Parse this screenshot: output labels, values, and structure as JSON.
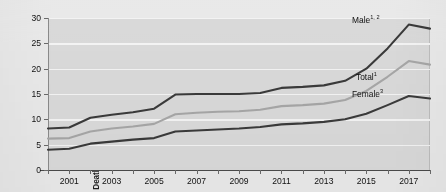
{
  "figure": {
    "title_fragment": "",
    "background_color": "#e9e9e9",
    "plot_background_color": "#d9d9d9",
    "gridline_color": "#f3f3f3"
  },
  "axis": {
    "ylabel": "Deaths per 100,000 standard population",
    "yticks": [
      "0",
      "5",
      "10",
      "15",
      "20",
      "25",
      "30"
    ],
    "xticks_labeled": [
      "2001",
      "2003",
      "2005",
      "2007",
      "2009",
      "2011",
      "2013",
      "2015",
      "2017"
    ]
  },
  "series_labels": {
    "male": "Male",
    "male_sup": "1, 2",
    "total": "Total",
    "total_sup": "1",
    "female": "Female",
    "female_sup": "3"
  },
  "chart_data": {
    "type": "line",
    "title": "",
    "xlabel": "",
    "ylabel": "Deaths per 100,000 standard population",
    "xlim": [
      2000,
      2018
    ],
    "ylim": [
      0,
      30
    ],
    "ytick_values": [
      0,
      5,
      10,
      15,
      20,
      25,
      30
    ],
    "xtick_values": [
      2000,
      2001,
      2002,
      2003,
      2004,
      2005,
      2006,
      2007,
      2008,
      2009,
      2010,
      2011,
      2012,
      2013,
      2014,
      2015,
      2016,
      2017,
      2018
    ],
    "xtick_labels_shown": [
      2001,
      2003,
      2005,
      2007,
      2009,
      2011,
      2013,
      2015,
      2017
    ],
    "grid": "horizontal",
    "legend": "inline-labels",
    "x": [
      2000,
      2001,
      2002,
      2003,
      2004,
      2005,
      2006,
      2007,
      2008,
      2009,
      2010,
      2011,
      2012,
      2013,
      2014,
      2015,
      2016,
      2017,
      2018
    ],
    "series": [
      {
        "name": "Male",
        "color": "#3a3a3a",
        "values": [
          8.2,
          8.4,
          10.3,
          10.9,
          11.4,
          12.1,
          14.9,
          15.0,
          15.0,
          15.0,
          15.2,
          16.2,
          16.4,
          16.7,
          17.6,
          20.0,
          24.0,
          28.7,
          27.9
        ]
      },
      {
        "name": "Total",
        "color": "#a6a6a6",
        "values": [
          6.2,
          6.3,
          7.6,
          8.2,
          8.6,
          9.1,
          11.0,
          11.3,
          11.5,
          11.6,
          11.9,
          12.6,
          12.8,
          13.1,
          13.8,
          15.6,
          18.4,
          21.5,
          20.8
        ]
      },
      {
        "name": "Female",
        "color": "#3a3a3a",
        "values": [
          4.0,
          4.2,
          5.2,
          5.6,
          6.0,
          6.3,
          7.6,
          7.8,
          8.0,
          8.2,
          8.5,
          9.0,
          9.2,
          9.5,
          10.0,
          11.1,
          12.8,
          14.6,
          14.1
        ]
      }
    ],
    "annotations": [
      {
        "text": "Male1, 2",
        "series": "Male",
        "near_x": 2016
      },
      {
        "text": "Total1",
        "series": "Total",
        "near_x": 2016
      },
      {
        "text": "Female3",
        "series": "Female",
        "near_x": 2016
      }
    ]
  }
}
